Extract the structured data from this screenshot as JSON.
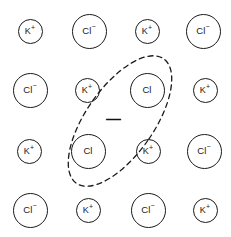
{
  "diagram": {
    "background_color": "#ffffff",
    "stroke_color": "#1a1a1a",
    "width": 231,
    "height": 237,
    "lattice": {
      "rows": 4,
      "columns": 4,
      "ions": [
        {
          "label": "K",
          "charge": "+",
          "text": "K+",
          "size": "small",
          "cx": 30,
          "cy": 31,
          "row": 1,
          "col": 1
        },
        {
          "label": "Cl",
          "charge": "−",
          "text": "Cl−",
          "size": "large",
          "cx": 89,
          "cy": 31,
          "row": 1,
          "col": 2
        },
        {
          "label": "K",
          "charge": "+",
          "text": "K+",
          "size": "small",
          "cx": 147,
          "cy": 31,
          "row": 1,
          "col": 3
        },
        {
          "label": "Cl",
          "charge": "−",
          "text": "Cl−",
          "size": "large",
          "cx": 203,
          "cy": 31,
          "row": 1,
          "col": 4
        },
        {
          "label": "Cl",
          "charge": "−",
          "text": "Cl−",
          "size": "large",
          "cx": 30,
          "cy": 90,
          "row": 2,
          "col": 1
        },
        {
          "label": "K",
          "charge": "+",
          "text": "K+",
          "size": "small",
          "cx": 87,
          "cy": 90,
          "row": 2,
          "col": 2
        },
        {
          "label": "Cl",
          "charge": "",
          "text": "Cl",
          "size": "large",
          "cx": 147,
          "cy": 90,
          "row": 2,
          "col": 3
        },
        {
          "label": "K",
          "charge": "+",
          "text": "K+",
          "size": "small",
          "cx": 205,
          "cy": 90,
          "row": 2,
          "col": 4
        },
        {
          "label": "K",
          "charge": "+",
          "text": "K+",
          "size": "small",
          "cx": 29,
          "cy": 151,
          "row": 3,
          "col": 1
        },
        {
          "label": "Cl",
          "charge": "",
          "text": "Cl",
          "size": "large",
          "cx": 88,
          "cy": 151,
          "row": 3,
          "col": 2
        },
        {
          "label": "K",
          "charge": "+",
          "text": "K+",
          "size": "small",
          "cx": 148,
          "cy": 151,
          "row": 3,
          "col": 3
        },
        {
          "label": "Cl",
          "charge": "−",
          "text": "Cl−",
          "size": "large",
          "cx": 204,
          "cy": 151,
          "row": 3,
          "col": 4
        },
        {
          "label": "Cl",
          "charge": "−",
          "text": "Cl−",
          "size": "large",
          "cx": 30,
          "cy": 210,
          "row": 4,
          "col": 1
        },
        {
          "label": "K",
          "charge": "+",
          "text": "K+",
          "size": "small",
          "cx": 88,
          "cy": 210,
          "row": 4,
          "col": 2
        },
        {
          "label": "Cl",
          "charge": "−",
          "text": "Cl−",
          "size": "large",
          "cx": 148,
          "cy": 210,
          "row": 4,
          "col": 4
        },
        {
          "label": "K",
          "charge": "+",
          "text": "K+",
          "size": "small",
          "cx": 205,
          "cy": 210,
          "row": 4,
          "col": 4
        }
      ]
    },
    "defect_region": {
      "shape": "ellipse",
      "style": "dashed",
      "center_x": 120,
      "center_y": 121,
      "radius_x": 34,
      "radius_y": 76,
      "rotation_deg": 35,
      "stroke_color": "#1a1a1a",
      "dash_pattern": "5 4"
    },
    "electron": {
      "symbol": "—",
      "meaning": "trapped electron",
      "x": 106,
      "y": 112
    }
  }
}
